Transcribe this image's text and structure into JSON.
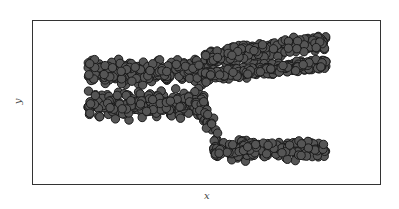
{
  "chart_data": {
    "type": "scatter",
    "title": "",
    "xlabel": "x",
    "ylabel": "y",
    "grid": false,
    "legend": null,
    "ticks": {
      "x": [],
      "y": []
    },
    "marker": {
      "shape": "circle",
      "fill": "#555555",
      "edge": "#1a1a1a",
      "radius_px": 4.2
    },
    "frame_px": {
      "left": 32,
      "top": 20,
      "right": 381,
      "bottom": 185
    },
    "series": [
      {
        "name": "left-upper-band",
        "x_range_px": [
          88,
          205
        ],
        "y_center_px": 72,
        "y_spread_px": 10
      },
      {
        "name": "left-lower-band",
        "x_range_px": [
          88,
          205
        ],
        "y_center_px": 104,
        "y_spread_px": 11
      },
      {
        "name": "right-top-band",
        "x_range_px": [
          205,
          326
        ],
        "y_center_start_px": 58,
        "y_center_end_px": 42,
        "y_spread_px": 7
      },
      {
        "name": "right-middle-band",
        "x_range_px": [
          205,
          326
        ],
        "y_center_start_px": 76,
        "y_center_end_px": 64,
        "y_spread_px": 5
      },
      {
        "name": "descending-arm",
        "x_range_px": [
          195,
          220
        ],
        "y_range_px": [
          100,
          140
        ]
      },
      {
        "name": "bottom-right-band",
        "x_range_px": [
          213,
          326
        ],
        "y_center_px": 150,
        "y_spread_px": 7
      }
    ]
  },
  "axes": {
    "x_label": "x",
    "y_label": "y"
  }
}
